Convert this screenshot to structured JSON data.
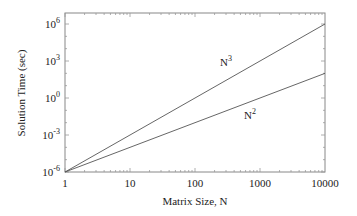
{
  "chart_data": {
    "type": "line",
    "title": "",
    "xlabel": "Matrix Size, N",
    "ylabel": "Solution Time (sec)",
    "xscale": "log",
    "yscale": "log",
    "xlim": [
      1,
      10000
    ],
    "ylim": [
      1e-06,
      8000000.0
    ],
    "x_ticks": [
      "1",
      "10",
      "100",
      "1000",
      "10000"
    ],
    "y_ticks": [
      {
        "base": "10",
        "exp": "-6"
      },
      {
        "base": "10",
        "exp": "-3"
      },
      {
        "base": "10",
        "exp": "0"
      },
      {
        "base": "10",
        "exp": "3"
      },
      {
        "base": "10",
        "exp": "6"
      }
    ],
    "grid": false,
    "legend": "inline labels",
    "series": [
      {
        "name": "N3",
        "label_base": "N",
        "label_exp": "3",
        "x": [
          1,
          10000
        ],
        "y": [
          1e-06,
          1000000.0
        ]
      },
      {
        "name": "N2",
        "label_base": "N",
        "label_exp": "2",
        "x": [
          1,
          10000
        ],
        "y": [
          1e-06,
          100.0
        ]
      }
    ]
  }
}
